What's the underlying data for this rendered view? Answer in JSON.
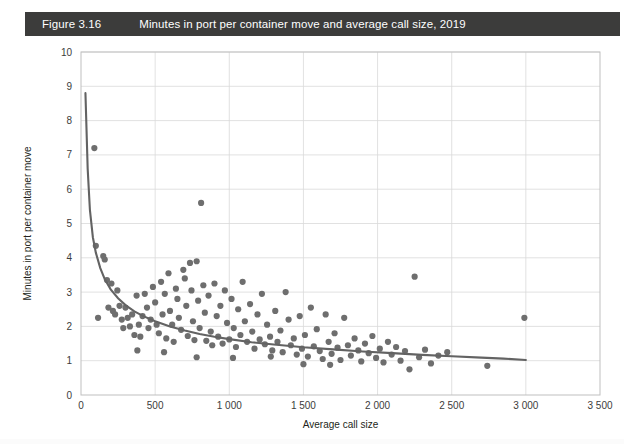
{
  "header": {
    "figure_number": "Figure 3.16",
    "title": "Minutes in port per container move and average call size, 2019",
    "bar_color": "#3c3c3b",
    "text_color": "#ffffff"
  },
  "chart_data": {
    "type": "scatter",
    "title": "Minutes in port per container move and average call size, 2019",
    "xlabel": "Average call size",
    "ylabel": "Minutes in port per container move",
    "xlim": [
      0,
      3500
    ],
    "ylim": [
      0,
      10
    ],
    "xticks": [
      0,
      500,
      1000,
      1500,
      2000,
      2500,
      3000,
      3500
    ],
    "xtick_labels": [
      "0",
      "500",
      "1 000",
      "1 500",
      "2 000",
      "2 500",
      "3 000",
      "3 500"
    ],
    "yticks": [
      0,
      1,
      2,
      3,
      4,
      5,
      6,
      7,
      8,
      9,
      10
    ],
    "ytick_labels": [
      "0",
      "1",
      "2",
      "3",
      "4",
      "5",
      "6",
      "7",
      "8",
      "9",
      "10"
    ],
    "grid": true,
    "legend": null,
    "point_color": "#6e6e6e",
    "point_radius": 3.1,
    "trend": {
      "type": "power-law",
      "color": "#636363",
      "label": "fitted decreasing curve",
      "x_start": 30,
      "x_end": 3000,
      "points": [
        [
          30,
          8.8
        ],
        [
          45,
          6.6
        ],
        [
          60,
          5.4
        ],
        [
          80,
          4.6
        ],
        [
          100,
          4.15
        ],
        [
          130,
          3.7
        ],
        [
          160,
          3.38
        ],
        [
          200,
          3.08
        ],
        [
          250,
          2.82
        ],
        [
          300,
          2.62
        ],
        [
          360,
          2.44
        ],
        [
          420,
          2.3
        ],
        [
          500,
          2.15
        ],
        [
          600,
          2.0
        ],
        [
          700,
          1.88
        ],
        [
          800,
          1.78
        ],
        [
          900,
          1.7
        ],
        [
          1000,
          1.63
        ],
        [
          1150,
          1.54
        ],
        [
          1300,
          1.47
        ],
        [
          1500,
          1.39
        ],
        [
          1700,
          1.33
        ],
        [
          1900,
          1.27
        ],
        [
          2100,
          1.22
        ],
        [
          2300,
          1.17
        ],
        [
          2500,
          1.13
        ],
        [
          2700,
          1.09
        ],
        [
          2850,
          1.06
        ],
        [
          3000,
          1.02
        ]
      ]
    },
    "points": [
      [
        90,
        7.2
      ],
      [
        100,
        4.35
      ],
      [
        115,
        2.25
      ],
      [
        150,
        4.05
      ],
      [
        160,
        3.95
      ],
      [
        175,
        3.35
      ],
      [
        185,
        2.55
      ],
      [
        205,
        3.25
      ],
      [
        215,
        2.45
      ],
      [
        230,
        2.35
      ],
      [
        245,
        3.05
      ],
      [
        260,
        2.6
      ],
      [
        275,
        2.2
      ],
      [
        285,
        1.95
      ],
      [
        300,
        2.55
      ],
      [
        315,
        2.25
      ],
      [
        330,
        2.0
      ],
      [
        345,
        2.35
      ],
      [
        360,
        1.75
      ],
      [
        375,
        2.9
      ],
      [
        390,
        2.05
      ],
      [
        400,
        1.7
      ],
      [
        415,
        2.3
      ],
      [
        430,
        2.95
      ],
      [
        445,
        2.55
      ],
      [
        455,
        1.95
      ],
      [
        470,
        2.2
      ],
      [
        485,
        3.15
      ],
      [
        500,
        2.7
      ],
      [
        510,
        2.05
      ],
      [
        525,
        1.8
      ],
      [
        540,
        3.3
      ],
      [
        550,
        2.35
      ],
      [
        565,
        2.95
      ],
      [
        575,
        1.65
      ],
      [
        590,
        3.55
      ],
      [
        600,
        2.45
      ],
      [
        615,
        2.05
      ],
      [
        625,
        1.55
      ],
      [
        640,
        3.1
      ],
      [
        650,
        2.8
      ],
      [
        660,
        2.25
      ],
      [
        675,
        1.9
      ],
      [
        690,
        3.65
      ],
      [
        700,
        3.4
      ],
      [
        710,
        2.6
      ],
      [
        720,
        1.72
      ],
      [
        735,
        3.85
      ],
      [
        745,
        3.05
      ],
      [
        755,
        2.15
      ],
      [
        765,
        1.6
      ],
      [
        780,
        3.9
      ],
      [
        790,
        2.75
      ],
      [
        800,
        1.95
      ],
      [
        810,
        5.6
      ],
      [
        825,
        3.2
      ],
      [
        835,
        2.4
      ],
      [
        845,
        1.58
      ],
      [
        860,
        2.9
      ],
      [
        875,
        1.85
      ],
      [
        885,
        1.45
      ],
      [
        900,
        3.25
      ],
      [
        915,
        2.3
      ],
      [
        925,
        1.7
      ],
      [
        940,
        2.6
      ],
      [
        955,
        1.5
      ],
      [
        970,
        3.05
      ],
      [
        985,
        2.1
      ],
      [
        1000,
        1.62
      ],
      [
        1015,
        2.8
      ],
      [
        1030,
        1.95
      ],
      [
        1045,
        1.4
      ],
      [
        1060,
        2.5
      ],
      [
        1075,
        1.75
      ],
      [
        1090,
        3.3
      ],
      [
        1105,
        2.15
      ],
      [
        1120,
        1.55
      ],
      [
        1140,
        2.65
      ],
      [
        1155,
        1.85
      ],
      [
        1170,
        1.35
      ],
      [
        1190,
        2.35
      ],
      [
        1205,
        1.62
      ],
      [
        1220,
        2.95
      ],
      [
        1240,
        1.48
      ],
      [
        1255,
        2.05
      ],
      [
        1275,
        1.7
      ],
      [
        1290,
        1.3
      ],
      [
        1310,
        2.45
      ],
      [
        1325,
        1.55
      ],
      [
        1345,
        1.88
      ],
      [
        1360,
        1.25
      ],
      [
        1380,
        3.0
      ],
      [
        1400,
        2.2
      ],
      [
        1415,
        1.45
      ],
      [
        1435,
        1.65
      ],
      [
        1455,
        1.18
      ],
      [
        1475,
        2.3
      ],
      [
        1490,
        1.35
      ],
      [
        1510,
        1.75
      ],
      [
        1530,
        1.12
      ],
      [
        1550,
        2.55
      ],
      [
        1570,
        1.42
      ],
      [
        1590,
        1.92
      ],
      [
        1610,
        1.28
      ],
      [
        1630,
        1.05
      ],
      [
        1650,
        2.35
      ],
      [
        1670,
        1.55
      ],
      [
        1690,
        1.2
      ],
      [
        1710,
        1.8
      ],
      [
        1730,
        1.38
      ],
      [
        1750,
        1.02
      ],
      [
        1775,
        2.25
      ],
      [
        1800,
        1.45
      ],
      [
        1820,
        1.15
      ],
      [
        1845,
        1.65
      ],
      [
        1870,
        1.3
      ],
      [
        1890,
        0.98
      ],
      [
        1915,
        1.5
      ],
      [
        1940,
        1.22
      ],
      [
        1965,
        1.72
      ],
      [
        1990,
        1.08
      ],
      [
        2015,
        1.35
      ],
      [
        2040,
        0.95
      ],
      [
        2070,
        1.55
      ],
      [
        2095,
        1.18
      ],
      [
        2125,
        1.4
      ],
      [
        2155,
        1.0
      ],
      [
        2185,
        1.28
      ],
      [
        2215,
        0.75
      ],
      [
        2250,
        3.45
      ],
      [
        2280,
        1.1
      ],
      [
        2320,
        1.32
      ],
      [
        2360,
        0.92
      ],
      [
        2410,
        1.15
      ],
      [
        2470,
        1.25
      ],
      [
        2990,
        2.25
      ],
      [
        2740,
        0.85
      ],
      [
        380,
        1.3
      ],
      [
        560,
        1.25
      ],
      [
        780,
        1.1
      ],
      [
        1025,
        1.08
      ],
      [
        1280,
        1.12
      ],
      [
        1500,
        0.9
      ],
      [
        1680,
        0.88
      ]
    ]
  }
}
